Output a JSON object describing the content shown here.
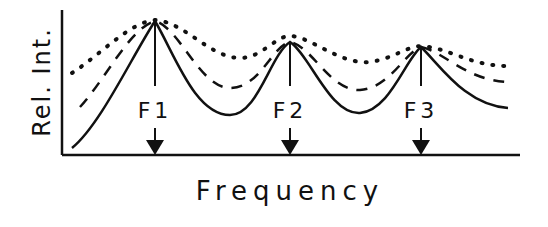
{
  "figure": {
    "ylabel": "Rel. Int.",
    "xlabel": "Frequency",
    "formants": [
      {
        "label": "F1",
        "x": 155,
        "peak_y": 21
      },
      {
        "label": "F2",
        "x": 290,
        "peak_y": 42
      },
      {
        "label": "F3",
        "x": 421,
        "peak_y": 47
      }
    ],
    "curves": [
      {
        "name": "narrow-bandwidth",
        "style": "solid"
      },
      {
        "name": "medium-bandwidth",
        "style": "dashed"
      },
      {
        "name": "wide-bandwidth",
        "style": "dotted"
      }
    ],
    "colors": {
      "ink": "#111111",
      "background": "#ffffff"
    }
  }
}
